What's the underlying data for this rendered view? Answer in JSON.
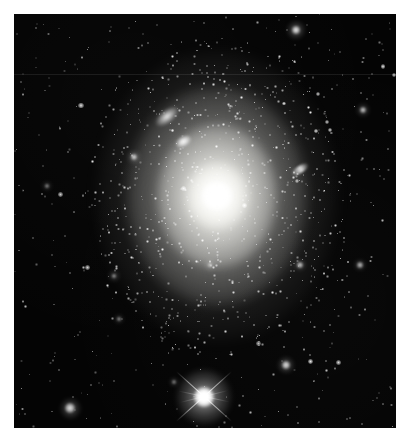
{
  "image": {
    "kind": "astronomical-photograph",
    "subject": "giant elliptical galaxy with globular cluster halo",
    "frame": {
      "width": 413,
      "height": 445,
      "border_color": "#ffffff",
      "border_width_px": 14,
      "plate_color": "#000000",
      "plate_width": 382,
      "plate_height": 414
    },
    "palette": {
      "background": "#000000",
      "sky": "#040404",
      "star": "#ffffff",
      "galaxy_core": "#ffffff",
      "halo_warm": "#fffffa",
      "mount": "#ffffff"
    },
    "artifacts": [
      {
        "name": "horizontal-scanline",
        "y": 60,
        "opacity": 0.085
      }
    ]
  },
  "objects": {
    "main_galaxy": {
      "name": "elliptical-galaxy",
      "core_x": 203,
      "core_y": 182,
      "halo_semimajor": 120,
      "halo_semiminor": 145,
      "position_angle_deg": 0,
      "description": "Diffuse centrally-concentrated elliptical galaxy with bright nucleus"
    },
    "companions": [
      {
        "name": "companion-lenticular",
        "x": 153,
        "y": 102,
        "angle_deg": -38,
        "length": 26
      },
      {
        "name": "companion-compact",
        "x": 169,
        "y": 127,
        "angle_deg": -30,
        "length": 17
      },
      {
        "name": "companion-edgeon-right",
        "x": 286,
        "y": 155,
        "angle_deg": -33,
        "length": 20
      }
    ],
    "bright_star": {
      "name": "foreground-star-with-diffraction-spikes",
      "x": 190,
      "y": 383,
      "halo_radius": 27,
      "spike_count": 4,
      "spike_angles_deg": [
        42,
        -42,
        12,
        -14
      ]
    },
    "notable_stars": [
      {
        "x": 282,
        "y": 16,
        "r": 4.2,
        "b": 1.0
      },
      {
        "x": 56,
        "y": 394,
        "r": 5.0,
        "b": 0.92
      },
      {
        "x": 272,
        "y": 351,
        "r": 4.0,
        "b": 0.95
      },
      {
        "x": 120,
        "y": 143,
        "r": 3.2,
        "b": 0.9
      },
      {
        "x": 349,
        "y": 96,
        "r": 3.0,
        "b": 0.85
      },
      {
        "x": 346,
        "y": 251,
        "r": 2.6,
        "b": 0.8
      },
      {
        "x": 286,
        "y": 251,
        "r": 2.8,
        "b": 0.85
      },
      {
        "x": 196,
        "y": 251,
        "r": 2.4,
        "b": 0.78
      },
      {
        "x": 100,
        "y": 262,
        "r": 2.4,
        "b": 0.75
      },
      {
        "x": 105,
        "y": 305,
        "r": 2.2,
        "b": 0.7
      },
      {
        "x": 33,
        "y": 172,
        "r": 2.0,
        "b": 0.68
      },
      {
        "x": 160,
        "y": 368,
        "r": 2.0,
        "b": 0.66
      }
    ],
    "star_field": {
      "description": "dense field of faint point sources across the whole plate",
      "approx_count": 520
    },
    "globular_clusters": {
      "description": "rich swarm of unresolved point sources concentrated around the elliptical galaxy",
      "approx_count": 640
    }
  }
}
